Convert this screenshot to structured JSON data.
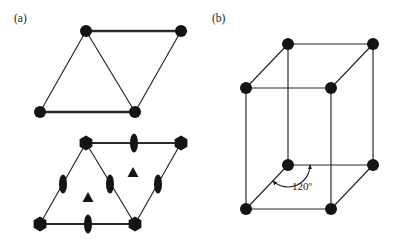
{
  "figure": {
    "background_color": "#ffffff",
    "ink_color": "#141414",
    "line_color": "#2a2a2a",
    "width": 397,
    "height": 246
  },
  "panels": [
    {
      "id": "a",
      "label": "(a)",
      "label_x": 14,
      "label_y": 22,
      "description": "hexagonal unit cell rhombus plus symmetry element diagram"
    },
    {
      "id": "b",
      "label": "(b)",
      "label_x": 212,
      "label_y": 22,
      "description": "three dimensional hexagonal prism unit cell"
    }
  ],
  "diagrams": {
    "rhombus_plain": {
      "name": "plain-rhombus",
      "vertices": [
        {
          "name": "top-left",
          "x": 86,
          "y": 31
        },
        {
          "name": "top-right",
          "x": 181,
          "y": 31
        },
        {
          "name": "bottom-right",
          "x": 135,
          "y": 112
        },
        {
          "name": "bottom-left",
          "x": 40,
          "y": 112
        }
      ],
      "edges": [
        {
          "from": 0,
          "to": 1,
          "width": 2.4
        },
        {
          "from": 1,
          "to": 2,
          "width": 1.2
        },
        {
          "from": 2,
          "to": 3,
          "width": 2.4
        },
        {
          "from": 3,
          "to": 0,
          "width": 1.2
        }
      ],
      "diagonal": {
        "from": 0,
        "to": 2,
        "width": 1.2
      },
      "node_radius": 6.0
    },
    "rhombus_symmetry": {
      "name": "symmetry-rhombus",
      "vertices": [
        {
          "name": "top-left",
          "x": 86,
          "y": 143
        },
        {
          "name": "top-right",
          "x": 181,
          "y": 143
        },
        {
          "name": "bottom-right",
          "x": 135,
          "y": 224
        },
        {
          "name": "bottom-left",
          "x": 40,
          "y": 224
        }
      ],
      "edges": [
        {
          "from": 0,
          "to": 1,
          "width": 2.0
        },
        {
          "from": 1,
          "to": 2,
          "width": 1.2
        },
        {
          "from": 2,
          "to": 3,
          "width": 2.0
        },
        {
          "from": 3,
          "to": 0,
          "width": 1.2
        }
      ],
      "diagonal": {
        "from": 0,
        "to": 2,
        "width": 1.2
      },
      "six_fold_axes": [
        {
          "name": "six-fold-top-left",
          "x": 86,
          "y": 143,
          "radius": 7.4
        },
        {
          "name": "six-fold-top-right",
          "x": 181,
          "y": 143,
          "radius": 7.4
        },
        {
          "name": "six-fold-bottom-right",
          "x": 135,
          "y": 224,
          "radius": 7.4
        },
        {
          "name": "six-fold-bottom-left",
          "x": 40,
          "y": 224,
          "radius": 7.4
        }
      ],
      "three_fold_axes": [
        {
          "name": "three-fold-upper",
          "x": 133,
          "y": 172,
          "size": 11
        },
        {
          "name": "three-fold-lower",
          "x": 88,
          "y": 197,
          "size": 11
        }
      ],
      "two_fold_axes": [
        {
          "name": "two-fold-top-edge",
          "x": 134,
          "y": 143,
          "rx": 4.0,
          "ry": 9.5,
          "rotation": 0
        },
        {
          "name": "two-fold-bottom-edge",
          "x": 88,
          "y": 224,
          "rx": 4.0,
          "ry": 9.5,
          "rotation": 0
        },
        {
          "name": "two-fold-left-edge",
          "x": 63,
          "y": 184,
          "rx": 4.0,
          "ry": 9.5,
          "rotation": 0
        },
        {
          "name": "two-fold-diagonal",
          "x": 110,
          "y": 184,
          "rx": 4.0,
          "ry": 9.5,
          "rotation": 0
        },
        {
          "name": "two-fold-right-edge",
          "x": 158,
          "y": 184,
          "rx": 4.0,
          "ry": 9.5,
          "rotation": 0
        }
      ]
    },
    "prism_cell": {
      "name": "hexagonal-prism-cell",
      "vertices": [
        {
          "name": "top-back-left",
          "x": 288,
          "y": 44
        },
        {
          "name": "top-back-right",
          "x": 373,
          "y": 44
        },
        {
          "name": "top-front-left",
          "x": 246,
          "y": 88
        },
        {
          "name": "top-front-right",
          "x": 331,
          "y": 88
        },
        {
          "name": "bottom-back-left",
          "x": 288,
          "y": 165
        },
        {
          "name": "bottom-back-right",
          "x": 373,
          "y": 165
        },
        {
          "name": "bottom-front-left",
          "x": 246,
          "y": 209
        },
        {
          "name": "bottom-front-right",
          "x": 331,
          "y": 209
        }
      ],
      "edges": [
        {
          "from": 0,
          "to": 1
        },
        {
          "from": 0,
          "to": 2
        },
        {
          "from": 1,
          "to": 3
        },
        {
          "from": 2,
          "to": 3
        },
        {
          "from": 4,
          "to": 5
        },
        {
          "from": 4,
          "to": 6
        },
        {
          "from": 5,
          "to": 7
        },
        {
          "from": 6,
          "to": 7
        },
        {
          "from": 0,
          "to": 4
        },
        {
          "from": 1,
          "to": 5
        },
        {
          "from": 2,
          "to": 6
        },
        {
          "from": 3,
          "to": 7
        }
      ],
      "node_radius": 6.0,
      "edge_width": 1.2,
      "angle_annotation": {
        "name": "angle-120",
        "text": "120º",
        "value": 120,
        "unit": "degrees",
        "label_x": 292,
        "label_y": 190,
        "vertex_x": 288,
        "vertex_y": 165
      }
    }
  }
}
